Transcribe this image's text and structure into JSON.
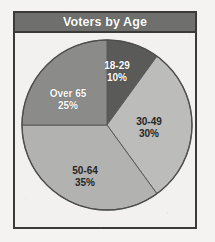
{
  "figure": {
    "title": "Voters by Age",
    "background_color": "#f2f1ef",
    "frame_color": "#3a3a38",
    "title_banner_color": "#6f6f6d",
    "title_text_color": "#ffffff"
  },
  "chart_data": {
    "type": "pie",
    "title": "Voters by Age",
    "xlabel": "",
    "ylabel": "",
    "legend": "none",
    "grid": false,
    "start_angle_deg": 0,
    "direction": "clockwise",
    "units": "percent",
    "total": 100,
    "categories": [
      "18-29",
      "30-49",
      "50-64",
      "Over 65"
    ],
    "values": [
      10,
      30,
      35,
      25
    ],
    "slices": [
      {
        "label": "18-29",
        "value": 10,
        "value_label": "10%",
        "color": "#5a5a58",
        "text_color": "#ffffff",
        "start_angle_deg": 0,
        "end_angle_deg": 36
      },
      {
        "label": "30-49",
        "value": 30,
        "value_label": "30%",
        "color": "#bcbcba",
        "text_color": "#262625",
        "start_angle_deg": 36,
        "end_angle_deg": 144
      },
      {
        "label": "50-64",
        "value": 35,
        "value_label": "35%",
        "color": "#b2b2b0",
        "text_color": "#262625",
        "start_angle_deg": 144,
        "end_angle_deg": 270
      },
      {
        "label": "Over 65",
        "value": 25,
        "value_label": "25%",
        "color": "#8b8b89",
        "text_color": "#ffffff",
        "start_angle_deg": 270,
        "end_angle_deg": 360
      }
    ]
  }
}
